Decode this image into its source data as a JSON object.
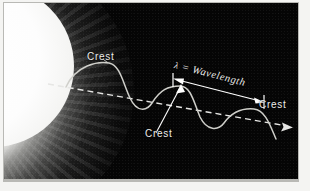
{
  "figure": {
    "kind": "electromagnetic-wave-diagram",
    "background_color": "#050505",
    "frame_color": "#f4f4f2",
    "stroke_color": "#ededeb",
    "sun_color": "#ffffff"
  },
  "labels": {
    "crest_top": "Crest",
    "crest_bottom": "Crest",
    "crest_right": "Crest",
    "wavelength_symbol": "λ",
    "wavelength_equals": " = ",
    "wavelength_text": "Wavelength"
  },
  "elements": {
    "sun_name": "sun",
    "corona_name": "solar-corona",
    "wave_name": "sine-wave",
    "axis_name": "propagation-axis-dashed-line",
    "axis_arrow_name": "propagation-direction-arrowhead",
    "wavelength_arrow_name": "wavelength-measure-arrow",
    "leader_top_name": "crest-top-leader-line",
    "leader_bottom_name": "crest-bottom-leader-line"
  },
  "geometry": {
    "axis_start": [
      44,
      81
    ],
    "axis_end": [
      288,
      124
    ],
    "wavelength_span_start": [
      172,
      76
    ],
    "wavelength_span_end": [
      258,
      98
    ],
    "wave_amplitude": 22,
    "wave_period": 86,
    "crest_points": [
      [
        105,
        60
      ],
      [
        190,
        83
      ],
      [
        274,
        106
      ]
    ]
  }
}
